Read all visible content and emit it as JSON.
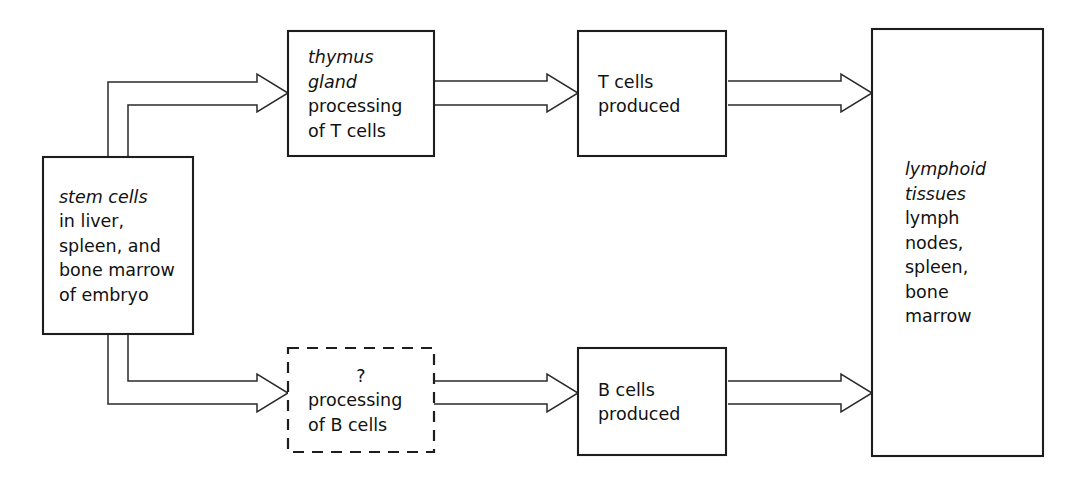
{
  "diagram": {
    "type": "flowchart",
    "background_color": "#ffffff",
    "stroke_color": "#1d1d1d",
    "nodes": [
      {
        "id": "stem-cells",
        "name": "stem-cells-box",
        "border": "solid",
        "x": 43,
        "y": 157,
        "width": 150,
        "height": 177,
        "lines": [
          {
            "text": "stem cells",
            "style": "italic"
          },
          {
            "text": "in liver,",
            "style": "normal"
          },
          {
            "text": "spleen, and",
            "style": "normal"
          },
          {
            "text": "bone marrow",
            "style": "normal"
          },
          {
            "text": "of embryo",
            "style": "normal"
          }
        ]
      },
      {
        "id": "thymus-gland",
        "name": "thymus-gland-box",
        "border": "solid",
        "x": 288,
        "y": 31,
        "width": 146,
        "height": 125,
        "lines": [
          {
            "text": "thymus",
            "style": "italic"
          },
          {
            "text": "gland",
            "style": "italic"
          },
          {
            "text": "processing",
            "style": "normal"
          },
          {
            "text": "of T cells",
            "style": "normal"
          }
        ]
      },
      {
        "id": "t-cells-produced",
        "name": "t-cells-produced-box",
        "border": "solid",
        "x": 578,
        "y": 31,
        "width": 148,
        "height": 125,
        "lines": [
          {
            "text": "T cells",
            "style": "normal"
          },
          {
            "text": "produced",
            "style": "normal"
          }
        ]
      },
      {
        "id": "b-cell-processing",
        "name": "b-cell-processing-box",
        "border": "dashed",
        "x": 288,
        "y": 348,
        "width": 146,
        "height": 104,
        "lines": [
          {
            "text": "?",
            "style": "normal",
            "align": "center"
          },
          {
            "text": "processing",
            "style": "normal"
          },
          {
            "text": "of B cells",
            "style": "normal"
          }
        ]
      },
      {
        "id": "b-cells-produced",
        "name": "b-cells-produced-box",
        "border": "solid",
        "x": 578,
        "y": 348,
        "width": 148,
        "height": 107,
        "lines": [
          {
            "text": "B cells",
            "style": "normal"
          },
          {
            "text": "produced",
            "style": "normal"
          }
        ]
      },
      {
        "id": "lymphoid-tissues",
        "name": "lymphoid-tissues-box",
        "border": "solid",
        "x": 872,
        "y": 29,
        "width": 171,
        "height": 427,
        "lines": [
          {
            "text": "lymphoid",
            "style": "italic"
          },
          {
            "text": "tissues",
            "style": "italic"
          },
          {
            "text": "lymph",
            "style": "normal"
          },
          {
            "text": "nodes,",
            "style": "normal"
          },
          {
            "text": "spleen,",
            "style": "normal"
          },
          {
            "text": "bone",
            "style": "normal"
          },
          {
            "text": "marrow",
            "style": "normal"
          }
        ]
      }
    ],
    "arrows": [
      {
        "id": "stem-to-thymus",
        "name": "arrow-stem-cells-to-thymus-gland",
        "kind": "elbow-up",
        "from": "stem-cells",
        "to": "thymus-gland",
        "geometry": {
          "leg_outer_x": 108,
          "leg_inner_x": 128,
          "leg_bottom_y": 157,
          "shaft_top_y": 82,
          "shaft_bottom_y": 105,
          "tip_x": 288,
          "tip_y": 93,
          "head_back_x": 257,
          "head_half": 19
        }
      },
      {
        "id": "thymus-to-tcells",
        "name": "arrow-thymus-gland-to-t-cells-produced",
        "kind": "straight",
        "from": "thymus-gland",
        "to": "t-cells-produced",
        "geometry": {
          "start_x": 434,
          "tip_x": 578,
          "shaft_top_y": 81,
          "shaft_bottom_y": 105,
          "tip_y": 93,
          "head_back_x": 547,
          "head_half": 19
        }
      },
      {
        "id": "tcells-to-lymphoid",
        "name": "arrow-t-cells-produced-to-lymphoid-tissues",
        "kind": "straight",
        "from": "t-cells-produced",
        "to": "lymphoid-tissues",
        "geometry": {
          "start_x": 728,
          "tip_x": 872,
          "shaft_top_y": 81,
          "shaft_bottom_y": 105,
          "tip_y": 93,
          "head_back_x": 841,
          "head_half": 19
        }
      },
      {
        "id": "stem-to-bprocessing",
        "name": "arrow-stem-cells-to-b-cell-processing",
        "kind": "elbow-down",
        "from": "stem-cells",
        "to": "b-cell-processing",
        "geometry": {
          "leg_outer_x": 108,
          "leg_inner_x": 128,
          "leg_top_y": 334,
          "shaft_top_y": 381,
          "shaft_bottom_y": 404,
          "tip_x": 288,
          "tip_y": 393,
          "head_back_x": 257,
          "head_half": 19
        }
      },
      {
        "id": "bprocessing-to-bcells",
        "name": "arrow-b-cell-processing-to-b-cells-produced",
        "kind": "straight",
        "from": "b-cell-processing",
        "to": "b-cells-produced",
        "geometry": {
          "start_x": 434,
          "tip_x": 578,
          "shaft_top_y": 381,
          "shaft_bottom_y": 404,
          "tip_y": 393,
          "head_back_x": 547,
          "head_half": 19
        }
      },
      {
        "id": "bcells-to-lymphoid",
        "name": "arrow-b-cells-produced-to-lymphoid-tissues",
        "kind": "straight",
        "from": "b-cells-produced",
        "to": "lymphoid-tissues",
        "geometry": {
          "start_x": 728,
          "tip_x": 872,
          "shaft_top_y": 381,
          "shaft_bottom_y": 404,
          "tip_y": 393,
          "head_back_x": 841,
          "head_half": 19
        }
      }
    ]
  }
}
